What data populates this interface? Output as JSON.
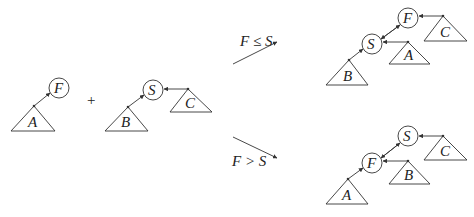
{
  "diagram": {
    "colors": {
      "stroke": "#333333",
      "text": "#222222",
      "background": "#ffffff"
    },
    "operator": "+",
    "conditions": {
      "upper": "F ≤ S",
      "lower": "F > S"
    },
    "input": {
      "left_tree": {
        "root": "F",
        "subtree": "A"
      },
      "right_tree": {
        "root": "S",
        "left_subtree": "B",
        "right_subtree": "C"
      }
    },
    "result_upper": {
      "root": "F",
      "right_subtree": "C",
      "child": "S",
      "child_left_subtree": "B",
      "child_right_subtree": "A"
    },
    "result_lower": {
      "root": "S",
      "right_subtree": "C",
      "child": "F",
      "child_left_subtree": "A",
      "child_right_subtree": "B"
    }
  }
}
